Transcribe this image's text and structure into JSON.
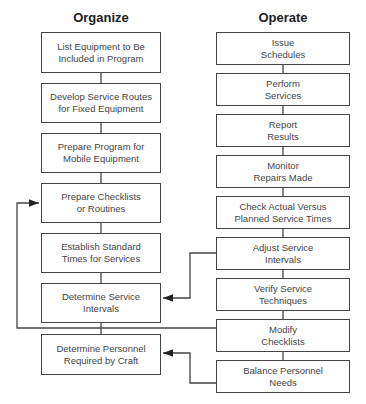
{
  "columns": {
    "organize": {
      "title": "Organize",
      "steps": [
        "List Equipment to Be\nIncluded in Program",
        "Develop Service Routes\nfor Fixed Equipment",
        "Prepare Program for\nMobile Equipment",
        "Prepare Checklists\nor Routines",
        "Establish Standard\nTimes for Services",
        "Determine Service\nIntervals",
        "Determine Personnel\nRequired by Craft"
      ]
    },
    "operate": {
      "title": "Operate",
      "steps": [
        "Issue\nSchedules",
        "Perform\nServices",
        "Report\nResults",
        "Monitor\nRepairs Made",
        "Check Actual Versus\nPlanned Service Times",
        "Adjust Service\nIntervals",
        "Verify Service\nTechniques",
        "Modify\nChecklists",
        "Balance Personnel\nNeeds"
      ]
    }
  },
  "feedback_links": [
    {
      "from": "Adjust Service Intervals",
      "to": "Determine Service Intervals"
    },
    {
      "from": "Modify Checklists",
      "to": "Prepare Checklists or Routines"
    },
    {
      "from": "Balance Personnel Needs",
      "to": "Determine Personnel Required by Craft"
    }
  ]
}
